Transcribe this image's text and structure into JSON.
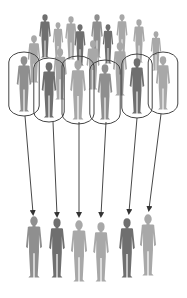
{
  "diagram": {
    "title": "",
    "concept": "sampling-from-population",
    "colors": {
      "background": "#ffffff",
      "person_light": "#a8a8a8",
      "person_mid": "#8f8f8f",
      "person_dark": "#6f6f6f",
      "outline": "#444444",
      "arrow": "#333333"
    },
    "population": {
      "label": "",
      "back_row": [
        {
          "x": 45,
          "y": 14,
          "h": 44,
          "shade": "dark"
        },
        {
          "x": 58,
          "y": 22,
          "h": 40,
          "shade": "light"
        },
        {
          "x": 71,
          "y": 16,
          "h": 44,
          "shade": "light"
        },
        {
          "x": 80,
          "y": 24,
          "h": 42,
          "shade": "dark"
        },
        {
          "x": 97,
          "y": 14,
          "h": 44,
          "shade": "mid"
        },
        {
          "x": 108,
          "y": 24,
          "h": 40,
          "shade": "dark"
        },
        {
          "x": 122,
          "y": 14,
          "h": 42,
          "shade": "light"
        },
        {
          "x": 139,
          "y": 19,
          "h": 44,
          "shade": "light"
        },
        {
          "x": 156,
          "y": 31,
          "h": 40,
          "shade": "light"
        },
        {
          "x": 34,
          "y": 35,
          "h": 48,
          "shade": "light"
        },
        {
          "x": 60,
          "y": 48,
          "h": 52,
          "shade": "light"
        },
        {
          "x": 93,
          "y": 40,
          "h": 50,
          "shade": "light"
        },
        {
          "x": 120,
          "y": 42,
          "h": 54,
          "shade": "light"
        }
      ],
      "selected": [
        {
          "x": 24,
          "y": 56,
          "h": 56,
          "shade": "mid"
        },
        {
          "x": 49,
          "y": 62,
          "h": 56,
          "shade": "dark"
        },
        {
          "x": 78,
          "y": 60,
          "h": 60,
          "shade": "light"
        },
        {
          "x": 105,
          "y": 64,
          "h": 56,
          "shade": "mid"
        },
        {
          "x": 137,
          "y": 58,
          "h": 56,
          "shade": "dark"
        },
        {
          "x": 163,
          "y": 56,
          "h": 54,
          "shade": "light"
        }
      ]
    },
    "sample": {
      "label": "",
      "people": [
        {
          "x": 34,
          "y": 216,
          "h": 62,
          "shade": "mid"
        },
        {
          "x": 57,
          "y": 218,
          "h": 60,
          "shade": "dark"
        },
        {
          "x": 79,
          "y": 220,
          "h": 62,
          "shade": "light"
        },
        {
          "x": 101,
          "y": 222,
          "h": 60,
          "shade": "light"
        },
        {
          "x": 127,
          "y": 218,
          "h": 60,
          "shade": "dark"
        },
        {
          "x": 148,
          "y": 214,
          "h": 62,
          "shade": "light"
        }
      ]
    },
    "arrows": [
      {
        "x1": 25,
        "y1": 116,
        "x2": 33,
        "y2": 213
      },
      {
        "x1": 53,
        "y1": 122,
        "x2": 57,
        "y2": 215
      },
      {
        "x1": 79,
        "y1": 122,
        "x2": 79,
        "y2": 215
      },
      {
        "x1": 106,
        "y1": 122,
        "x2": 101,
        "y2": 215
      },
      {
        "x1": 137,
        "y1": 118,
        "x2": 129,
        "y2": 212
      },
      {
        "x1": 161,
        "y1": 114,
        "x2": 149,
        "y2": 209
      }
    ]
  }
}
